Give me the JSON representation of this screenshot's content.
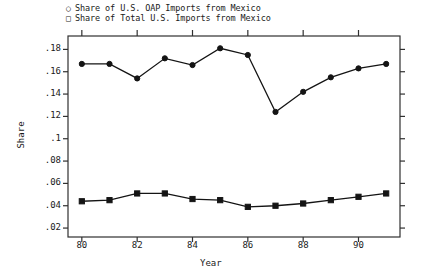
{
  "chart_data": {
    "type": "line",
    "title": "",
    "xlabel": "Year",
    "ylabel": "Share",
    "xlim": [
      79.5,
      91.5
    ],
    "ylim": [
      0.012,
      0.192
    ],
    "xticks": [
      "80",
      "82",
      "84",
      "86",
      "88",
      "90"
    ],
    "xtick_values": [
      80,
      82,
      84,
      86,
      88,
      90
    ],
    "yticks": [
      ".02",
      ".04",
      ".06",
      ".08",
      ".1",
      ".12",
      ".14",
      ".16",
      ".18"
    ],
    "ytick_values": [
      0.02,
      0.04,
      0.06,
      0.08,
      0.1,
      0.12,
      0.14,
      0.16,
      0.18
    ],
    "grid": false,
    "legend_position": "above-plot-left",
    "x": [
      80,
      81,
      82,
      83,
      84,
      85,
      86,
      87,
      88,
      89,
      90,
      91
    ],
    "series": [
      {
        "name": "Share of U.S. OAP Imports from Mexico",
        "marker": "circle",
        "values": [
          0.167,
          0.167,
          0.154,
          0.172,
          0.166,
          0.181,
          0.175,
          0.124,
          0.142,
          0.155,
          0.163,
          0.167
        ]
      },
      {
        "name": "Share of Total U.S. Imports from Mexico",
        "marker": "square",
        "values": [
          0.044,
          0.045,
          0.051,
          0.051,
          0.046,
          0.045,
          0.039,
          0.04,
          0.042,
          0.045,
          0.048,
          0.051
        ]
      }
    ]
  },
  "legend": {
    "entries": [
      {
        "marker_glyph": "○",
        "label": "Share of U.S. OAP Imports from Mexico"
      },
      {
        "marker_glyph": "□",
        "label": "Share of Total U.S. Imports from Mexico"
      }
    ]
  },
  "axes": {
    "y_title": "Share",
    "x_title": "Year"
  },
  "colors": {
    "line": "#141414",
    "axis": "#303030",
    "background": "#ffffff",
    "text": "#1a1a1a"
  }
}
